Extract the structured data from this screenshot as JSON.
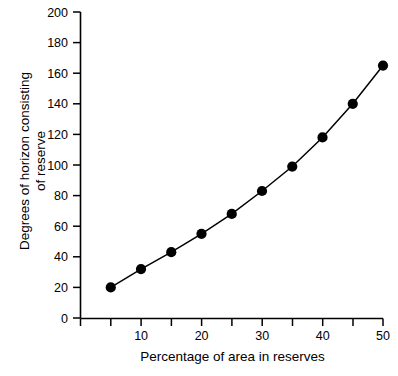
{
  "chart_data": {
    "type": "line",
    "title": "",
    "subtitle": "",
    "xlabel": "Percentage of area in reserves",
    "ylabel": "Degrees of horizon consisting\nof reserve",
    "x": [
      5,
      10,
      15,
      20,
      25,
      30,
      35,
      40,
      45,
      50
    ],
    "values": [
      20,
      32,
      43,
      55,
      68,
      83,
      99,
      118,
      140,
      165
    ],
    "series": [
      {
        "name": "Degrees of horizon consisting of reserve",
        "x": [
          5,
          10,
          15,
          20,
          25,
          30,
          35,
          40,
          45,
          50
        ],
        "values": [
          20,
          32,
          43,
          55,
          68,
          83,
          99,
          118,
          140,
          165
        ]
      }
    ],
    "xlim": [
      0,
      50
    ],
    "ylim": [
      0,
      200
    ],
    "xticks": [
      0,
      5,
      10,
      15,
      20,
      25,
      30,
      35,
      40,
      45,
      50
    ],
    "xtick_labels": [
      "",
      "",
      "10",
      "",
      "20",
      "",
      "30",
      "",
      "40",
      "",
      "50"
    ],
    "yticks": [
      0,
      20,
      40,
      60,
      80,
      100,
      120,
      140,
      160,
      180,
      200
    ],
    "ytick_labels": [
      "0",
      "20",
      "40",
      "60",
      "80",
      "100",
      "120",
      "140",
      "160",
      "180",
      "200"
    ],
    "grid": false,
    "legend": false,
    "legend_position": "none",
    "marker": "filled-circle",
    "marker_color": "#000000",
    "line_color": "#000000",
    "background_color": "#ffffff",
    "annotations": []
  },
  "axis": {
    "y_tick_labels": {
      "t0": "0",
      "t20": "20",
      "t40": "40",
      "t60": "60",
      "t80": "80",
      "t100": "100",
      "t120": "120",
      "t140": "140",
      "t160": "160",
      "t180": "180",
      "t200": "200"
    },
    "x_tick_labels": {
      "t10": "10",
      "t20": "20",
      "t30": "30",
      "t40": "40",
      "t50": "50"
    }
  },
  "labels": {
    "x_axis_title": "Percentage of area in reserves",
    "y_axis_title": "Degrees of horizon consisting\nof reserve"
  }
}
